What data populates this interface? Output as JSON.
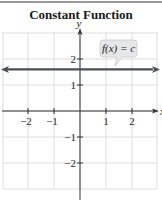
{
  "chart_data": {
    "type": "line",
    "title": "Constant Function",
    "xlabel": "x",
    "ylabel": "y",
    "xlim": [
      -3,
      3
    ],
    "ylim": [
      -3,
      3
    ],
    "grid": true,
    "x_ticks": [
      -2,
      -1,
      1,
      2
    ],
    "y_ticks": [
      2,
      1,
      -1,
      -2
    ],
    "x_tick_labels": [
      "−2",
      "−1",
      "1",
      "2"
    ],
    "y_tick_labels": [
      "2",
      "1",
      "−1",
      "−2"
    ],
    "series": [
      {
        "name": "f(x) = c",
        "x": [
          -3,
          3
        ],
        "y": [
          1.6,
          1.6
        ],
        "color": "#4a4f55",
        "arrows": "both"
      }
    ],
    "annotations": [
      {
        "text": "f(x) = c",
        "type": "callout",
        "x": 1.5,
        "y": 2.3
      }
    ],
    "legend": "none"
  },
  "colors": {
    "grid": "#dcdcdc",
    "axis": "#333333",
    "function_line": "#4a4f55",
    "callout_fill": "#e6e7e9",
    "callout_stroke": "#c8c9cc"
  }
}
